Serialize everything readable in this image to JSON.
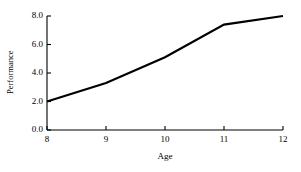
{
  "chart_data": {
    "type": "line",
    "title": "",
    "xlabel": "Age",
    "ylabel": "Performance",
    "x": [
      8,
      9,
      10,
      11,
      12
    ],
    "values": [
      2.0,
      3.3,
      5.1,
      7.4,
      8.0
    ],
    "series": [
      {
        "name": "Performance",
        "values": [
          2.0,
          3.3,
          5.1,
          7.4,
          8.0
        ]
      }
    ],
    "xticks": [
      8,
      9,
      10,
      11,
      12
    ],
    "xtick_labels": [
      "8",
      "9",
      "10",
      "11",
      "12"
    ],
    "yticks": [
      0.0,
      2.0,
      4.0,
      6.0,
      8.0
    ],
    "ytick_labels": [
      "0.0",
      "2.0",
      "4.0",
      "6.0",
      "8.0"
    ],
    "xlim": [
      8,
      12
    ],
    "ylim": [
      0.0,
      8.0
    ],
    "grid": false,
    "legend": false,
    "legend_position": "none",
    "line_color": "#000000",
    "line_width": 2.2,
    "background_color": "#ffffff",
    "axis_color": "#000000",
    "tick_direction": "in"
  }
}
